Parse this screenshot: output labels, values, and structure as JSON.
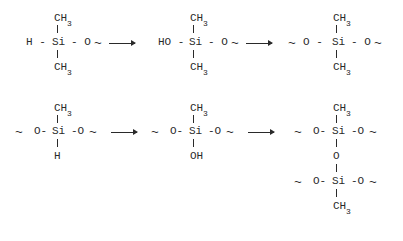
{
  "diagram": {
    "type": "chemical-reaction-scheme",
    "rows": [
      {
        "structures": [
          {
            "top": "CH",
            "top_sub": "3",
            "left": "H -",
            "center": "Si",
            "right": "- O",
            "chain": "~",
            "bottom": "CH",
            "bottom_sub": "3"
          },
          {
            "top": "CH",
            "top_sub": "3",
            "left": "HO -",
            "center": "Si",
            "right": "- O",
            "chain": "~",
            "bottom": "CH",
            "bottom_sub": "3"
          },
          {
            "top": "CH",
            "top_sub": "3",
            "left_chain": "~",
            "left": "O -",
            "center": "Si",
            "right": "- O",
            "chain": "~",
            "bottom": "CH",
            "bottom_sub": "3"
          }
        ],
        "arrows": [
          "→",
          "→"
        ]
      },
      {
        "structures": [
          {
            "top": "CH",
            "top_sub": "3",
            "left_chain": "~",
            "left": "O-",
            "center": "Si",
            "right": "-O",
            "chain": "~",
            "bottom": "H"
          },
          {
            "top": "CH",
            "top_sub": "3",
            "left_chain": "~",
            "left": "O-",
            "center": "Si",
            "right": "-O",
            "chain": "~",
            "bottom": "OH"
          },
          {
            "top": "CH",
            "top_sub": "3",
            "left_chain": "~",
            "left": "O-",
            "center": "Si",
            "right": "-O",
            "chain": "~",
            "bridge": "O",
            "lower_left_chain": "~",
            "lower_left": "O-",
            "lower_center": "Si",
            "lower_right": "-O",
            "lower_chain": "~",
            "bottom": "CH",
            "bottom_sub": "3"
          }
        ],
        "arrows": [
          "→",
          "→"
        ]
      }
    ]
  }
}
